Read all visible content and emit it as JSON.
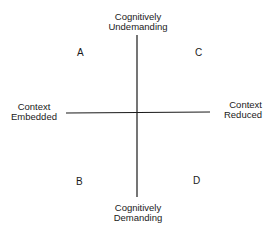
{
  "axes": {
    "top": {
      "line1": "Cognitively",
      "line2": "Undemanding"
    },
    "bottom": {
      "line1": "Cognitively",
      "line2": "Demanding"
    },
    "left": {
      "line1": "Context",
      "line2": "Embedded"
    },
    "right": {
      "line1": "Context",
      "line2": "Reduced"
    }
  },
  "quadrants": {
    "top_left": "A",
    "top_right": "C",
    "bottom_left": "B",
    "bottom_right": "D"
  },
  "colors": {
    "line": "#1a1a1a",
    "text": "#1a1a1a",
    "background": "#ffffff"
  }
}
